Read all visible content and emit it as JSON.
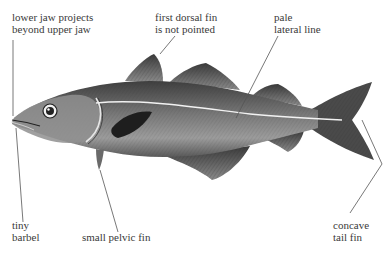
{
  "diagram": {
    "labels": {
      "lower_jaw": {
        "line1": "lower jaw projects",
        "line2": "beyond upper jaw"
      },
      "dorsal_fin": {
        "line1": "first dorsal fin",
        "line2": "is not pointed"
      },
      "lateral_line": {
        "line1": "pale",
        "line2": "lateral line"
      },
      "barbel": {
        "line1": "tiny",
        "line2": "barbel"
      },
      "pelvic_fin": {
        "line1": "small pelvic fin"
      },
      "tail_fin": {
        "line1": "concave",
        "line2": "tail fin"
      }
    },
    "colors": {
      "body_dark": "#4a4a4a",
      "body_mid": "#8a8a8a",
      "belly": "#bdbdbd",
      "lateral_line": "#f0f0f0",
      "leader_line": "#555555",
      "text": "#3a3a3a"
    }
  }
}
